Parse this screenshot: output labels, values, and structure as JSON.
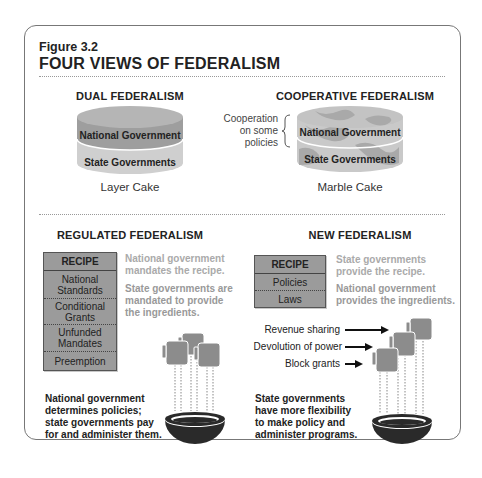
{
  "figure": {
    "number": "Figure 3.2",
    "title": "FOUR VIEWS OF FEDERALISM"
  },
  "dual": {
    "heading": "DUAL FEDERALISM",
    "top_layer": "National Government",
    "bottom_layer": "State Governments",
    "caption": "Layer Cake"
  },
  "cooperative": {
    "heading": "COOPERATIVE FEDERALISM",
    "note_line1": "Cooperation",
    "note_line2": "on some",
    "note_line3": "policies",
    "top_layer": "National Government",
    "bottom_layer": "State Governments",
    "caption": "Marble Cake"
  },
  "regulated": {
    "heading": "REGULATED FEDERALISM",
    "recipe_header": "RECIPE",
    "recipe_items": [
      "National Standards",
      "Conditional Grants",
      "Unfunded Mandates",
      "Preemption"
    ],
    "note1_line1": "National government",
    "note1_line2": "mandates the recipe.",
    "note2_line1": "State governments are",
    "note2_line2": "mandated to provide",
    "note2_line3": "the ingredients.",
    "bottom_line1": "National government",
    "bottom_line2": "determines policies;",
    "bottom_line3": "state governments pay",
    "bottom_line4": "for and administer them."
  },
  "new": {
    "heading": "NEW FEDERALISM",
    "recipe_header": "RECIPE",
    "recipe_items": [
      "Policies",
      "Laws"
    ],
    "note1_line1": "State governments",
    "note1_line2": "provide the recipe.",
    "note2_line1": "National government",
    "note2_line2": "provides the ingredients.",
    "arrows": [
      "Revenue sharing",
      "Devolution of power",
      "Block grants"
    ],
    "bottom_line1": "State governments",
    "bottom_line2": "have more flexibility",
    "bottom_line3": "to make policy and",
    "bottom_line4": "administer programs."
  },
  "colors": {
    "national_layer": "#9e9e9e",
    "state_layer": "#cfcfcf",
    "marble_light": "#c9c9c9",
    "marble_dark": "#a9a9a9",
    "recipe_fill": "#9b9b9b",
    "bowl": "#2a2a2a",
    "faded_text": "#aaaaaa"
  }
}
